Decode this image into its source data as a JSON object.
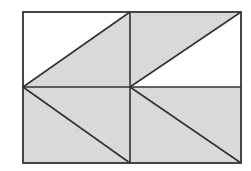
{
  "diagram": {
    "title": "",
    "colors": {
      "background": "#ffffff",
      "shade": "#d9d9d9",
      "stroke": "#333333"
    },
    "outer_rect": {
      "x1": 23,
      "y1": 12,
      "x2": 241,
      "y2": 163
    },
    "mid_x": 130,
    "mid_y": 87,
    "shaded_regions": [
      {
        "name": "top-left-triangle",
        "points": "23,87 130,12 130,87"
      },
      {
        "name": "top-right-triangle",
        "points": "130,12 241,12 130,87"
      },
      {
        "name": "bottom-left-rect",
        "points": "23,87 130,87 130,163 23,163"
      },
      {
        "name": "bottom-right-rect",
        "points": "130,87 241,87 241,163 130,163"
      }
    ],
    "lines": [
      {
        "name": "diagonal-top-left",
        "x1": 23,
        "y1": 87,
        "x2": 130,
        "y2": 12
      },
      {
        "name": "diagonal-top-right",
        "x1": 130,
        "y1": 87,
        "x2": 241,
        "y2": 12
      },
      {
        "name": "diagonal-bottom-left",
        "x1": 23,
        "y1": 87,
        "x2": 130,
        "y2": 163
      },
      {
        "name": "diagonal-bottom-right",
        "x1": 130,
        "y1": 87,
        "x2": 241,
        "y2": 163
      },
      {
        "name": "vertical-midline",
        "x1": 130,
        "y1": 12,
        "x2": 130,
        "y2": 163
      },
      {
        "name": "horizontal-midline",
        "x1": 23,
        "y1": 87,
        "x2": 241,
        "y2": 87
      }
    ]
  }
}
